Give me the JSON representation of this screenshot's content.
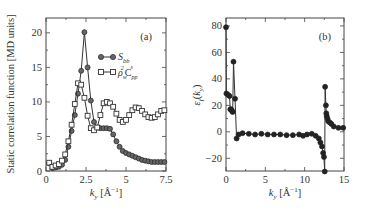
{
  "figure": {
    "panels": [
      "(a)",
      "(b)"
    ]
  },
  "chart_data": [
    {
      "type": "line",
      "panel_label": "(a)",
      "title": "",
      "xlabel": "k_y [Å^-1]",
      "ylabel": "Static correlation function [MD units]",
      "xlim": [
        0,
        7.5
      ],
      "ylim": [
        0,
        22
      ],
      "xticks": [
        0,
        2.5,
        5,
        7.5
      ],
      "xtick_labels": [
        "0",
        "2.5",
        "5",
        "7.5"
      ],
      "yticks": [
        0,
        5,
        10,
        15,
        20
      ],
      "ytick_labels": [
        "0",
        "5",
        "10",
        "15",
        "20"
      ],
      "grid": false,
      "legend_position": "upper right",
      "series": [
        {
          "name": "S_bb",
          "marker": "filled-circle",
          "x": [
            0.2,
            0.4,
            0.6,
            0.8,
            1.0,
            1.2,
            1.4,
            1.6,
            1.8,
            2.0,
            2.2,
            2.4,
            2.6,
            2.8,
            3.0,
            3.2,
            3.4,
            3.6,
            3.8,
            4.0,
            4.2,
            4.4,
            4.6,
            4.8,
            5.0,
            5.2,
            5.4,
            5.6,
            5.8,
            6.0,
            6.2,
            6.4,
            6.6,
            6.8,
            7.0,
            7.2,
            7.4
          ],
          "values": [
            1.1,
            0.4,
            0.5,
            0.6,
            0.9,
            1.6,
            3.5,
            5.8,
            8.1,
            11.2,
            14.5,
            20.1,
            15.0,
            10.2,
            7.1,
            6.3,
            6.2,
            6.2,
            6.2,
            6.1,
            5.3,
            4.3,
            3.5,
            2.9,
            2.6,
            2.4,
            2.2,
            2.0,
            1.8,
            1.6,
            1.5,
            1.4,
            1.3,
            1.3,
            1.3,
            1.3,
            1.3
          ]
        },
        {
          "name": "ρ_w² C_pp^s",
          "marker": "open-square",
          "x": [
            0.2,
            0.4,
            0.6,
            0.8,
            1.0,
            1.2,
            1.4,
            1.6,
            1.8,
            2.0,
            2.2,
            2.4,
            2.6,
            2.8,
            3.0,
            3.2,
            3.4,
            3.6,
            3.8,
            4.0,
            4.2,
            4.4,
            4.6,
            4.8,
            5.0,
            5.2,
            5.4,
            5.6,
            5.8,
            6.0,
            6.2,
            6.4,
            6.6,
            6.8,
            7.0,
            7.2,
            7.4
          ],
          "values": [
            1.2,
            0.6,
            0.8,
            1.0,
            1.5,
            2.4,
            4.3,
            6.7,
            9.7,
            12.7,
            12.5,
            10.6,
            8.0,
            6.2,
            5.9,
            6.3,
            8.1,
            9.8,
            10.0,
            9.8,
            9.3,
            8.3,
            7.4,
            7.1,
            7.4,
            8.1,
            8.8,
            9.2,
            9.1,
            8.7,
            8.2,
            7.8,
            7.7,
            7.8,
            8.2,
            8.7,
            8.8
          ]
        }
      ]
    },
    {
      "type": "line",
      "panel_label": "(b)",
      "title": "",
      "xlabel": "k_y [Å^-1]",
      "ylabel": "ε_f(k_y)",
      "xlim": [
        0,
        15
      ],
      "ylim": [
        -30,
        85
      ],
      "xticks": [
        0,
        5,
        10,
        15
      ],
      "xtick_labels": [
        "0",
        "5",
        "10",
        "15"
      ],
      "yticks": [
        -20,
        0,
        20,
        40,
        60,
        80
      ],
      "ytick_labels": [
        "−20",
        "0",
        "20",
        "40",
        "60",
        "80"
      ],
      "grid": false,
      "series": [
        {
          "name": "ε_f(k_y)",
          "marker": "filled-circle",
          "x": [
            0.0,
            0.05,
            0.25,
            0.45,
            0.55,
            0.65,
            0.75,
            0.85,
            0.95,
            1.15,
            1.35,
            1.6,
            2.1,
            2.9,
            3.7,
            4.5,
            5.3,
            6.1,
            6.9,
            7.7,
            8.5,
            9.3,
            9.8,
            10.3,
            10.9,
            11.4,
            11.8,
            12.0,
            12.2,
            12.35,
            12.45,
            12.55,
            12.6,
            12.7,
            12.75,
            12.8,
            12.9,
            13.0,
            13.2,
            13.4,
            13.7,
            14.3,
            14.9
          ],
          "values": [
            79,
            29,
            28,
            27,
            17,
            17,
            16,
            15,
            53,
            25,
            -5,
            -2,
            -1,
            -1.5,
            -2,
            -1.5,
            -2,
            -2,
            -2,
            -2.5,
            -2.5,
            -2,
            -3,
            -2,
            -1.5,
            -3,
            -5,
            -8,
            -11,
            -16,
            -19,
            -30,
            34,
            20,
            14,
            12,
            10,
            8,
            7,
            6,
            4,
            3,
            3
          ]
        }
      ]
    }
  ]
}
